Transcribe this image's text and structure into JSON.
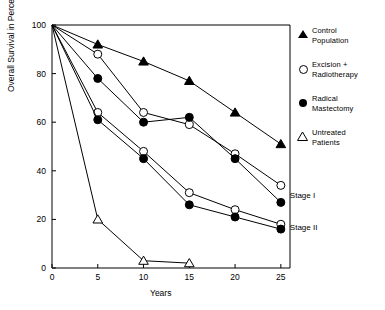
{
  "chart_data": {
    "type": "line",
    "title": "",
    "xlabel": "Years",
    "ylabel": "Overall Survival in Percent",
    "x": [
      0,
      5,
      10,
      15,
      20,
      25
    ],
    "xlim": [
      0,
      26
    ],
    "ylim": [
      0,
      100
    ],
    "xticks": [
      "0",
      "5",
      "10",
      "15",
      "20",
      "25"
    ],
    "yticks": [
      "0",
      "20",
      "40",
      "60",
      "80",
      "100"
    ],
    "grid": false,
    "legend_position": "right",
    "series": [
      {
        "name": "Control Population",
        "marker": "filled-triangle",
        "stage": "",
        "x": [
          0,
          5,
          10,
          15,
          20,
          25
        ],
        "values": [
          100,
          92,
          85,
          77,
          64,
          51
        ]
      },
      {
        "name": "Excision + Radiotherapy",
        "marker": "open-circle",
        "stage": "Stage I",
        "x": [
          0,
          5,
          10,
          15,
          20,
          25
        ],
        "values": [
          100,
          88,
          64,
          59,
          47,
          34
        ]
      },
      {
        "name": "Radical Mastectomy",
        "marker": "filled-circle",
        "stage": "Stage I",
        "x": [
          0,
          5,
          10,
          15,
          20,
          25
        ],
        "values": [
          100,
          78,
          60,
          62,
          45,
          27
        ]
      },
      {
        "name": "Excision + Radiotherapy",
        "marker": "open-circle",
        "stage": "Stage II",
        "x": [
          0,
          5,
          10,
          15,
          20,
          25
        ],
        "values": [
          100,
          64,
          48,
          31,
          24,
          18
        ]
      },
      {
        "name": "Radical Mastectomy",
        "marker": "filled-circle",
        "stage": "Stage II",
        "x": [
          0,
          5,
          10,
          15,
          20,
          25
        ],
        "values": [
          100,
          61,
          45,
          26,
          21,
          16
        ]
      },
      {
        "name": "Untreated Patients",
        "marker": "open-triangle",
        "stage": "",
        "x": [
          0,
          5,
          10,
          15
        ],
        "values": [
          100,
          20,
          3,
          2
        ]
      }
    ],
    "annotations": [
      {
        "label": "Stage I",
        "x": 25,
        "y": 30
      },
      {
        "label": "Stage II",
        "x": 25,
        "y": 17
      }
    ]
  },
  "legend": {
    "items": [
      {
        "label_line1": "Control",
        "label_line2": "Population",
        "marker": "filled-triangle"
      },
      {
        "label_line1": "Excision +",
        "label_line2": "Radiotherapy",
        "marker": "open-circle"
      },
      {
        "label_line1": "Radical",
        "label_line2": "Mastectomy",
        "marker": "filled-circle"
      },
      {
        "label_line1": "Untreated",
        "label_line2": "Patients",
        "marker": "open-triangle"
      }
    ]
  },
  "axes": {
    "x_title": "Years",
    "y_title": "Overall Survival in Percent"
  }
}
